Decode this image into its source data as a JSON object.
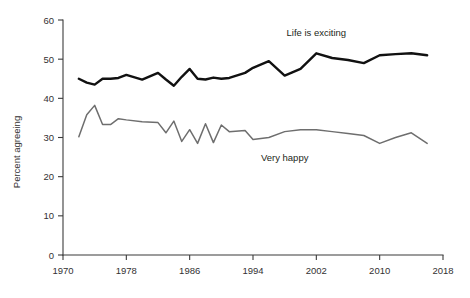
{
  "chart_data": {
    "type": "line",
    "title": "",
    "subtitle": "",
    "xlabel": "",
    "ylabel": "Percent agreeing",
    "xlim": [
      1970,
      2018
    ],
    "ylim": [
      0,
      60
    ],
    "grid": false,
    "legend_position": "inline-annotation",
    "x_ticks": [
      1970,
      1978,
      1986,
      1994,
      2002,
      2010,
      2018
    ],
    "y_ticks": [
      0,
      10,
      20,
      30,
      40,
      50,
      60
    ],
    "x": [
      1972,
      1973,
      1974,
      1975,
      1976,
      1977,
      1978,
      1980,
      1982,
      1983,
      1984,
      1985,
      1986,
      1987,
      1988,
      1989,
      1990,
      1991,
      1993,
      1994,
      1996,
      1998,
      2000,
      2002,
      2004,
      2006,
      2008,
      2010,
      2012,
      2014,
      2016
    ],
    "series": [
      {
        "name": "Life is exciting",
        "color": "#111111",
        "label_x": 2002,
        "label_y": 56,
        "values": [
          45.0,
          44.0,
          43.5,
          45.0,
          45.0,
          45.2,
          46.0,
          44.8,
          46.5,
          44.8,
          43.2,
          45.5,
          47.5,
          45.0,
          44.8,
          45.3,
          45.0,
          45.2,
          46.5,
          47.8,
          49.5,
          45.8,
          47.5,
          51.5,
          50.3,
          49.8,
          49.0,
          51.0,
          51.3,
          51.5,
          51.0
        ]
      },
      {
        "name": "Very happy",
        "color": "#6e6e6e",
        "label_x": 1998,
        "label_y": 24,
        "values": [
          30.2,
          35.8,
          38.2,
          33.3,
          33.3,
          34.8,
          34.5,
          34.0,
          33.8,
          31.2,
          34.2,
          29.0,
          32.0,
          28.5,
          33.5,
          28.7,
          33.2,
          31.5,
          31.8,
          29.5,
          30.0,
          31.5,
          32.0,
          32.0,
          31.5,
          31.0,
          30.5,
          28.5,
          30.0,
          31.2,
          28.5
        ]
      }
    ]
  }
}
